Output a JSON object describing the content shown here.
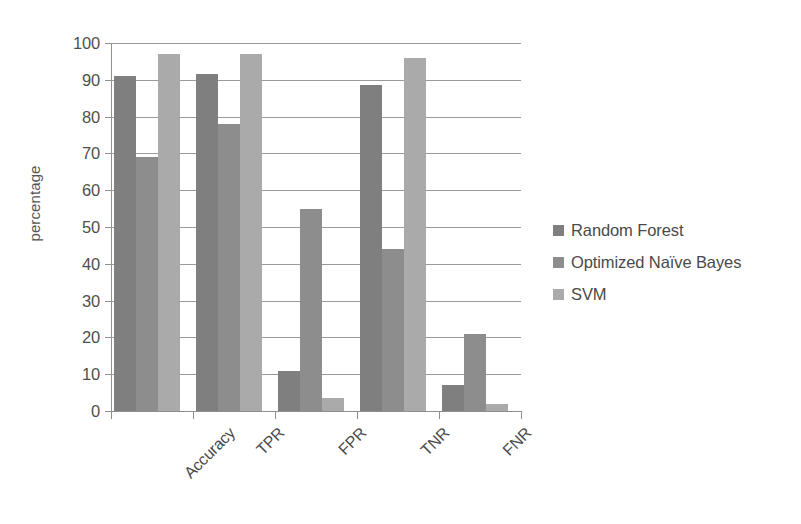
{
  "chart_data": {
    "type": "bar",
    "title": "",
    "xlabel": "",
    "ylabel": "percentage",
    "categories": [
      "Accuracy",
      "TPR",
      "FPR",
      "TNR",
      "FNR"
    ],
    "series": [
      {
        "name": "Random Forest",
        "color": "#7f7f7f",
        "values": [
          91,
          91.5,
          11,
          88.5,
          7
        ]
      },
      {
        "name": "Optimized Naïve Bayes",
        "color": "#8d8d8d",
        "values": [
          69,
          78,
          55,
          44,
          21
        ]
      },
      {
        "name": "SVM",
        "color": "#aaaaaa",
        "values": [
          97,
          97,
          3.5,
          96,
          2
        ]
      }
    ],
    "ylim": [
      0,
      100
    ],
    "yticks": [
      0,
      10,
      20,
      30,
      40,
      50,
      60,
      70,
      80,
      90,
      100
    ],
    "ytick_labels": [
      "0",
      "10",
      "20",
      "30",
      "40",
      "50",
      "60",
      "70",
      "80",
      "90",
      "100"
    ],
    "grid": true,
    "legend_position": "right",
    "legend_entries": [
      "Random Forest",
      "Optimized Naïve Bayes",
      "SVM"
    ]
  }
}
